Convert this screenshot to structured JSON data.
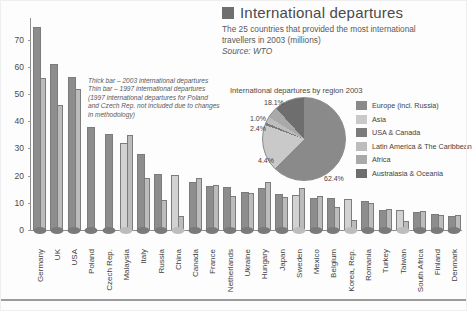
{
  "header": {
    "title": "International departures",
    "subtitle": "The 25 countries that provided the most international travellers in 2003 (millions)",
    "source": "Source: WTO",
    "swatch_color": "#6f6f6f"
  },
  "note": "Thick bar – 2003 international departures Thin bar – 1997 international departures (1997 international departures for Poland and Czech Rep. not included due to changes in methodology)",
  "axis": {
    "yticks": [
      "70",
      "60",
      "50",
      "40",
      "30",
      "20",
      "10",
      "0"
    ]
  },
  "pie_panel": {
    "title": "International departures by region 2003"
  },
  "colors": {
    "bar_2003": "#8d8d8d",
    "bar_1997": "#bcbcbc",
    "bar_pale": "#d2d2d2",
    "axis": "#8f8f8f",
    "marker": "#7a7a7a"
  },
  "chart_data": [
    {
      "type": "bar",
      "title": "International departures",
      "subtitle": "The 25 countries that provided the most international travellers in 2003 (millions)",
      "source": "Source: WTO",
      "xlabel": "",
      "ylabel": "",
      "ylim": [
        0,
        78
      ],
      "yticks": [
        0,
        10,
        20,
        30,
        40,
        50,
        60,
        70
      ],
      "grid": false,
      "legend_position": "none",
      "annotation": "Thick bar – 2003 international departures; Thin bar – 1997 international departures (1997 international departures for Poland and Czech Rep. not included due to changes in methodology)",
      "categories": [
        "Germany",
        "UK",
        "USA",
        "Poland",
        "Czech Rep.",
        "Malaysia",
        "Italy",
        "Russia",
        "China",
        "Canada",
        "France",
        "Netherlands",
        "Ukraine",
        "Hungary",
        "Japan",
        "Sweden",
        "Mexico",
        "Belgium",
        "Korea, Rep.",
        "Romania",
        "Turkey",
        "Taiwan",
        "South Africa",
        "Finland",
        "Denmark"
      ],
      "series": [
        {
          "name": "2003 international departures",
          "values": [
            74.6,
            61.0,
            56.3,
            38.0,
            35.4,
            32.0,
            28.0,
            20.5,
            20.1,
            17.7,
            16.2,
            15.9,
            14.0,
            15.6,
            13.3,
            12.8,
            11.7,
            11.9,
            11.5,
            10.6,
            7.4,
            7.3,
            6.7,
            5.8,
            5.2,
            5.0
          ],
          "color": "#8d8d8d"
        },
        {
          "name": "1997 international departures",
          "values": [
            55.8,
            46.0,
            52.0,
            null,
            null,
            34.8,
            19.0,
            11.0,
            5.2,
            19.0,
            16.5,
            12.5,
            13.8,
            17.5,
            12.3,
            15.6,
            12.4,
            8.6,
            3.6,
            9.9,
            7.8,
            3.4,
            6.9,
            5.4,
            5.6,
            3.8
          ],
          "color": "#bcbcbc"
        }
      ]
    },
    {
      "type": "pie",
      "title": "International departures by region 2003",
      "legend_position": "right",
      "labels": [
        "Europe (incl. Russia)",
        "Asia",
        "USA & Canada",
        "Latin America & The Caribbean",
        "Africa",
        "Australasia & Oceania"
      ],
      "values": [
        62.4,
        18.1,
        1.0,
        2.4,
        4.4,
        11.7
      ],
      "value_labels": [
        "62.4%",
        "18.1%",
        "1.0%",
        "2.4%",
        "4.4%",
        ""
      ],
      "colors": [
        "#8a8a8a",
        "#c9c9c9",
        "#7b7b7b",
        "#bdbdbd",
        "#a9a9a9",
        "#6e6e6e"
      ]
    }
  ]
}
